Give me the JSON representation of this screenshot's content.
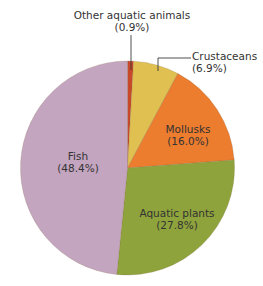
{
  "chart_data": {
    "type": "pie",
    "title": "",
    "start_angle_deg": 0,
    "direction": "clockwise",
    "slices": [
      {
        "label": "Other aquatic animals",
        "value": 0.9,
        "display": "(0.9%)",
        "color": "#c8482a"
      },
      {
        "label": "Crustaceans",
        "value": 6.9,
        "display": "(6.9%)",
        "color": "#dfc050"
      },
      {
        "label": "Mollusks",
        "value": 16.0,
        "display": "(16.0%)",
        "color": "#ec7c2e"
      },
      {
        "label": "Aquatic plants",
        "value": 27.8,
        "display": "(27.8%)",
        "color": "#8fa33c"
      },
      {
        "label": "Fish",
        "value": 48.4,
        "display": "(48.4%)",
        "color": "#c4a5c0"
      }
    ],
    "categories": [
      "Other aquatic animals",
      "Crustaceans",
      "Mollusks",
      "Aquatic plants",
      "Fish"
    ],
    "values": [
      0.9,
      6.9,
      16.0,
      27.8,
      48.4
    ],
    "unit": "%",
    "legend": "none (direct labels)"
  },
  "labels": {
    "other": {
      "name": "Other aquatic animals",
      "pct": "(0.9%)"
    },
    "crustaceans": {
      "name": "Crustaceans",
      "pct": "(6.9%)"
    },
    "mollusks": {
      "name": "Mollusks",
      "pct": "(16.0%)"
    },
    "plants": {
      "name": "Aquatic plants",
      "pct": "(27.8%)"
    },
    "fish": {
      "name": "Fish",
      "pct": "(48.4%)"
    }
  }
}
